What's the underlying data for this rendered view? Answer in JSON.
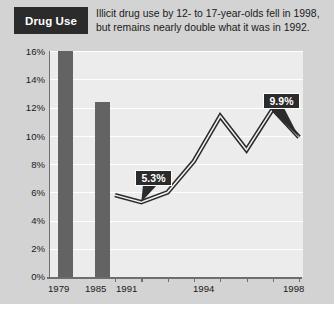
{
  "header": {
    "tag": "Drug Use",
    "deck_line1": "Illicit drug use by 12- to 17-year-olds fell in 1998,",
    "deck_line2": "but remains nearly double what it was in 1992."
  },
  "chart_data": {
    "type": "bar",
    "title": "Drug Use",
    "subtitle": "Illicit drug use by 12- to 17-year-olds fell in 1998, but remains nearly double what it was in 1992.",
    "xlabel": "",
    "ylabel": "",
    "ylim": [
      0,
      16
    ],
    "ytick_labels": [
      "0%",
      "2%",
      "4%",
      "6%",
      "8%",
      "10%",
      "12%",
      "14%",
      "16%"
    ],
    "ytick_values": [
      0,
      2,
      4,
      6,
      8,
      10,
      12,
      14,
      16
    ],
    "xtick_labels": [
      "1979",
      "1985",
      "1991",
      "1994",
      "1998"
    ],
    "grid": true,
    "legend": false,
    "series": [
      {
        "name": "Earlier years (bars)",
        "type": "bar",
        "categories": [
          "1979",
          "1985"
        ],
        "values": [
          16.0,
          12.7
        ]
      },
      {
        "name": "Annual rate (line)",
        "type": "line",
        "x": [
          "1991",
          "1992",
          "1993",
          "1994",
          "1995",
          "1996",
          "1997",
          "1998"
        ],
        "values": [
          5.8,
          5.3,
          6.0,
          8.2,
          11.4,
          9.0,
          11.9,
          9.9
        ]
      }
    ],
    "annotations": [
      {
        "label": "5.3%",
        "x": "1992",
        "y": 5.3
      },
      {
        "label": "9.9%",
        "x": "1998",
        "y": 9.9
      }
    ],
    "colors": {
      "bar": "#636363",
      "line": "#2b2b2b",
      "callout_bg": "#2b2b2b",
      "callout_text": "#ffffff",
      "band_dark": "#c9c9c9",
      "band_light": "#ededed",
      "background": "#d3d3d3"
    }
  },
  "ylabels": [
    {
      "text": "16%",
      "top": 46
    },
    {
      "text": "14%",
      "top": 74
    },
    {
      "text": "12%",
      "top": 102
    },
    {
      "text": "10%",
      "top": 131
    },
    {
      "text": "8%",
      "top": 159
    },
    {
      "text": "6%",
      "top": 187
    },
    {
      "text": "4%",
      "top": 215
    },
    {
      "text": "2%",
      "top": 243
    },
    {
      "text": "0%",
      "top": 271
    }
  ],
  "xlabels": [
    {
      "text": "1979",
      "left": 48
    },
    {
      "text": "1985",
      "left": 85
    },
    {
      "text": "1991",
      "left": 116
    },
    {
      "text": "1994",
      "left": 193
    },
    {
      "text": "1998",
      "left": 283
    }
  ],
  "bars": [
    {
      "name": "1979",
      "left": 58,
      "top": 51,
      "width": 15,
      "height": 226
    },
    {
      "name": "1985",
      "left": 95,
      "top": 102,
      "width": 15,
      "height": 175
    }
  ],
  "callouts": [
    {
      "label": "5.3%",
      "left": 135,
      "top": 170,
      "width": 37
    },
    {
      "label": "9.9%",
      "left": 263,
      "top": 93,
      "width": 37
    }
  ]
}
